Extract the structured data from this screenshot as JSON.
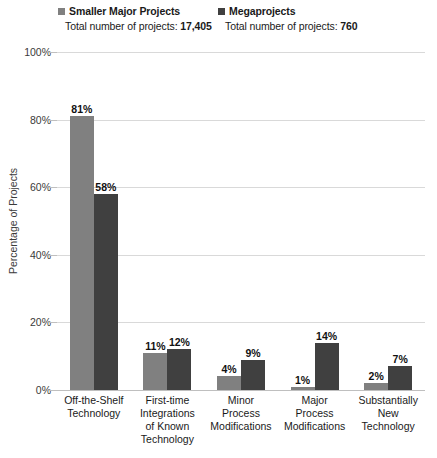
{
  "legend": {
    "entries": [
      {
        "label": "Smaller Major Projects",
        "total_text_prefix": "Total number of projects: ",
        "total_value": "17,405",
        "color": "#808080",
        "swatch_name": "legend-swatch-smaller-major-projects"
      },
      {
        "label": "Megaprojects",
        "total_text_prefix": "Total number of projects: ",
        "total_value": "760",
        "color": "#404040",
        "swatch_name": "legend-swatch-megaprojects"
      }
    ]
  },
  "chart_data": {
    "type": "bar",
    "title": "",
    "xlabel": "",
    "ylabel": "Percentage of Projects",
    "ylim": [
      0,
      100
    ],
    "ytick_labels": [
      "100%",
      "80%",
      "60%",
      "40%",
      "20%",
      "0%"
    ],
    "ytick_values": [
      100,
      80,
      60,
      40,
      20,
      0
    ],
    "grid": true,
    "legend_position": "top",
    "categories": [
      "Off-the-Shelf Technology",
      "First-time Integrations of Known Technology",
      "Minor Process Modifications",
      "Major Process Modifications",
      "Substantially New Technology"
    ],
    "category_lines": [
      [
        "Off-the-Shelf",
        "Technology"
      ],
      [
        "First-time",
        "Integrations",
        "of Known",
        "Technology"
      ],
      [
        "Minor",
        "Process",
        "Modifications"
      ],
      [
        "Major",
        "Process",
        "Modifications"
      ],
      [
        "Substantially",
        "New",
        "Technology"
      ]
    ],
    "series": [
      {
        "name": "Smaller Major Projects",
        "color": "#808080",
        "values": [
          81,
          11,
          4,
          1,
          2
        ],
        "labels": [
          "81%",
          "11%",
          "4%",
          "1%",
          "2%"
        ]
      },
      {
        "name": "Megaprojects",
        "color": "#404040",
        "values": [
          58,
          12,
          9,
          14,
          7
        ],
        "labels": [
          "58%",
          "12%",
          "9%",
          "14%",
          "7%"
        ]
      }
    ]
  }
}
